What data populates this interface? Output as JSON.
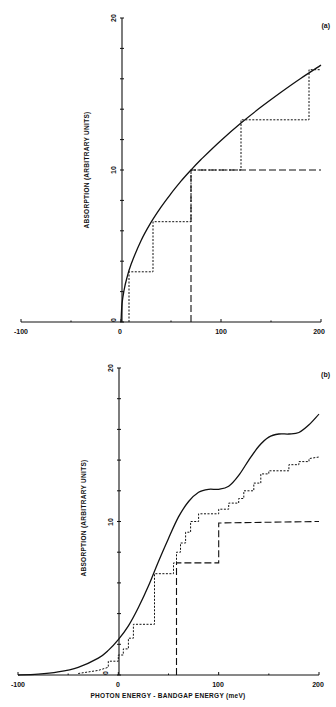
{
  "chart_data": [
    {
      "panel": "(a)",
      "type": "line",
      "title": "",
      "xlabel": "",
      "ylabel": "ABSORPTION (ARBITRARY UNITS)",
      "xlim": [
        -100,
        200
      ],
      "ylim": [
        0,
        20
      ],
      "x_ticks": [
        -100,
        0,
        100,
        200
      ],
      "y_ticks": [
        0,
        10,
        20
      ],
      "grid": false,
      "series": [
        {
          "name": "solid (3D square-root)",
          "style": "solid",
          "x": [
            0,
            1,
            3,
            6,
            10,
            20,
            30,
            40,
            50,
            60,
            70,
            80,
            100,
            120,
            140,
            160,
            180,
            200
          ],
          "y": [
            0,
            1.2,
            2.07,
            2.93,
            3.78,
            5.35,
            6.55,
            7.56,
            8.45,
            9.26,
            10.0,
            10.69,
            11.95,
            13.09,
            14.14,
            15.12,
            16.04,
            16.9
          ]
        },
        {
          "name": "dotted (stepped)",
          "style": "dotted",
          "x": [
            8,
            8,
            32,
            32,
            70,
            70,
            120,
            120,
            188,
            188,
            200
          ],
          "y": [
            0,
            3.3,
            3.3,
            6.6,
            6.6,
            10.0,
            10.0,
            13.3,
            13.3,
            16.6,
            16.6
          ]
        },
        {
          "name": "dashed (single step)",
          "style": "dashed",
          "x": [
            70,
            70,
            200
          ],
          "y": [
            0,
            10.0,
            10.0
          ]
        }
      ]
    },
    {
      "panel": "(b)",
      "type": "line",
      "title": "",
      "xlabel": "PHOTON ENERGY - BANDGAP ENERGY (meV)",
      "ylabel": "ABSORPTION (ARBITRARY UNITS)",
      "xlim": [
        -100,
        200
      ],
      "ylim": [
        0,
        20
      ],
      "x_ticks": [
        -100,
        0,
        100,
        200
      ],
      "y_ticks": [
        0,
        10,
        20
      ],
      "grid": false,
      "series": [
        {
          "name": "solid (broadened)",
          "style": "solid",
          "x": [
            -100,
            -80,
            -60,
            -40,
            -20,
            -10,
            0,
            10,
            20,
            30,
            40,
            50,
            60,
            70,
            80,
            90,
            100,
            110,
            120,
            130,
            140,
            150,
            160,
            170,
            180,
            190,
            200
          ],
          "y": [
            0,
            0.05,
            0.2,
            0.5,
            1.1,
            1.6,
            2.3,
            3.2,
            4.4,
            5.8,
            7.4,
            8.9,
            10.3,
            11.3,
            11.9,
            12.1,
            12.1,
            12.3,
            13.0,
            14.0,
            14.9,
            15.5,
            15.7,
            15.7,
            15.8,
            16.3,
            17.0
          ]
        },
        {
          "name": "dotted (stepped)",
          "style": "dotted",
          "x": [
            -40,
            -20,
            -10,
            -10,
            0,
            0,
            5,
            5,
            10,
            10,
            15,
            15,
            36,
            36,
            55,
            55,
            58,
            58,
            62,
            62,
            67,
            67,
            72,
            72,
            80,
            80,
            100,
            100,
            110,
            110,
            120,
            120,
            125,
            125,
            135,
            135,
            142,
            142,
            150,
            150,
            170,
            170,
            180,
            180,
            190,
            190,
            200
          ],
          "y": [
            0.1,
            0.3,
            0.5,
            0.9,
            0.9,
            1.3,
            1.3,
            1.7,
            1.7,
            2.4,
            2.4,
            3.3,
            3.3,
            6.6,
            6.6,
            7.3,
            7.3,
            8.0,
            8.0,
            8.6,
            8.6,
            9.3,
            9.3,
            10.0,
            10.0,
            10.5,
            10.5,
            10.8,
            10.8,
            11.2,
            11.2,
            11.5,
            11.5,
            12.0,
            12.0,
            12.5,
            12.5,
            13.1,
            13.1,
            13.3,
            13.3,
            13.7,
            13.7,
            13.9,
            13.9,
            14.1,
            14.2
          ]
        },
        {
          "name": "dashed (stepped)",
          "style": "dashed",
          "x": [
            58,
            58,
            100,
            100,
            200
          ],
          "y": [
            0,
            7.3,
            7.3,
            9.9,
            10.0
          ]
        }
      ]
    }
  ],
  "panels": {
    "a": {
      "label": "(a)",
      "ylabel": "ABSORPTION (ARBITRARY UNITS)",
      "y_tick_labels": [
        "0",
        "10",
        "20"
      ],
      "x_tick_labels": [
        "-100",
        "0",
        "100",
        "200"
      ]
    },
    "b": {
      "label": "(b)",
      "ylabel": "ABSORPTION (ARBITRARY UNITS)",
      "xlabel": "PHOTON ENERGY - BANDGAP ENERGY (meV)",
      "y_tick_labels": [
        "0",
        "10",
        "20"
      ],
      "x_tick_labels": [
        "-100",
        "0",
        "100",
        "200"
      ]
    }
  }
}
